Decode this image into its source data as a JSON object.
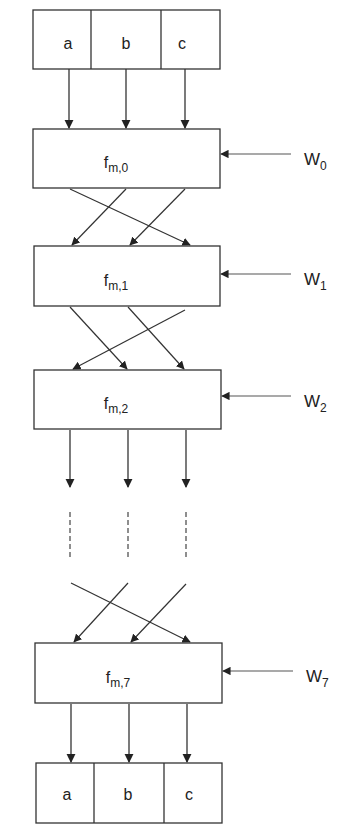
{
  "input_registers": {
    "cells": [
      "a",
      "b",
      "c"
    ]
  },
  "output_registers": {
    "cells": [
      "a",
      "b",
      "c"
    ]
  },
  "stages": [
    {
      "func": "f",
      "sub": "m,0",
      "key": "W",
      "key_sub": "0"
    },
    {
      "func": "f",
      "sub": "m,1",
      "key": "W",
      "key_sub": "1"
    },
    {
      "func": "f",
      "sub": "m,2",
      "key": "W",
      "key_sub": "2"
    },
    {
      "func": "f",
      "sub": "m,7",
      "key": "W",
      "key_sub": "7"
    }
  ],
  "colors": {
    "stroke": "#333333",
    "background": "#ffffff"
  }
}
